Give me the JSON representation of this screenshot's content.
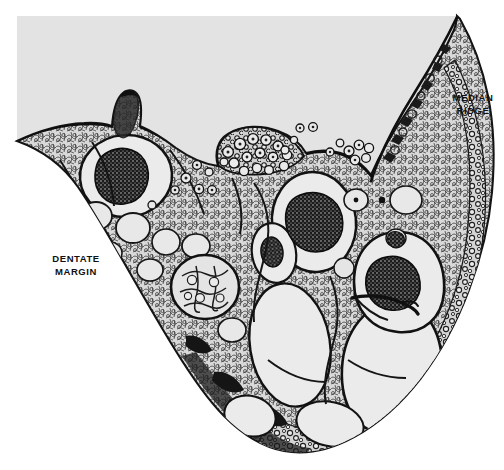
{
  "figure": {
    "kind": "histology-section-plate",
    "background_color": "#ffffff",
    "plate_color": "#e3e3e3",
    "tissue_fill": "#dcdcdc",
    "ink_color": "#141414",
    "lumen_fill": "#ebebeb",
    "nucleus_fill": "#1a1a1a",
    "width": 504,
    "height": 470
  },
  "annotations": {
    "dentate_margin": {
      "text": "DENTATE\nMARGIN",
      "line1": "DENTATE",
      "line2": "MARGIN",
      "color": "#111111"
    },
    "median_ridge": {
      "text": "MEDIAN\nRIDGE",
      "line1": "MEDIAN",
      "line2": "RIDGE",
      "color": "#111111"
    }
  },
  "structures": {
    "plate_outline": "M 17 16 L 455 16 L 470 30 L 484 70 L 492 120 L 493 180 L 487 250 L 470 320 L 440 380 L 392 424 L 330 452 L 268 452 L 210 420 L 150 350 L 96 280 L 52 214 L 17 150 Z",
    "tissue_outline": "M 17 141 C 38 131 58 125 78 124 C 92 123 104 124 112 125 C 114 112 117 100 122 94 C 127 88 133 88 137 93 C 141 98 142 110 140 124 C 150 128 160 134 170 142 C 186 152 202 160 218 163 C 214 150 216 138 224 132 C 236 123 256 122 272 127 C 288 132 298 140 304 150 C 318 146 332 146 344 150 C 356 154 364 160 370 168 C 378 150 392 128 408 106 C 424 84 440 56 452 30 C 456 22 458 18 458 17 C 472 38 482 64 488 94 C 494 124 495 156 492 190 C 489 224 482 256 470 288 C 458 320 442 350 422 376 C 402 402 380 422 356 436 C 332 450 308 456 286 452 C 264 448 244 436 226 418 C 208 400 192 376 176 350 C 160 324 144 296 128 268 C 112 240 96 212 80 188 C 64 164 44 150 17 141 Z",
    "labels_on_plate": [
      "DENTATE MARGIN",
      "MEDIAN RIDGE"
    ]
  }
}
